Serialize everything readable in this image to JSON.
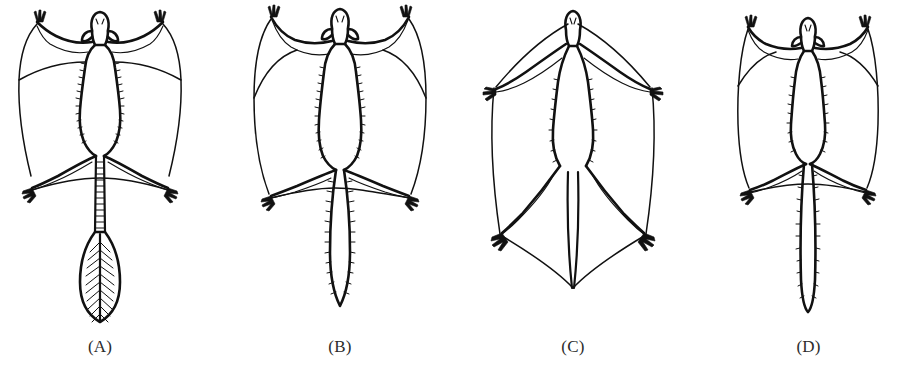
{
  "figure": {
    "kind": "scientific-line-drawing",
    "background_color": "#ffffff",
    "ink_color": "#111111",
    "label_color": "#2b2b2b",
    "width": 899,
    "height": 382
  },
  "panels": [
    {
      "id": "A",
      "label": "(A)",
      "center_x": 95,
      "description": "glider with long scaly tail ending in a feather-like plume; patagium spans wrist to ankle",
      "tail_type": "feather-tail",
      "tail_visible": true
    },
    {
      "id": "B",
      "label": "(B)",
      "center_x": 340,
      "description": "glider with broad, densely furred tapering tail; large rectangular patagium",
      "tail_type": "bushy-furred-tail",
      "tail_visible": true
    },
    {
      "id": "C",
      "label": "(C)",
      "center_x": 573,
      "description": "glider with membrane continuing between hind legs enclosing a short tail; widest patagium",
      "tail_type": "interfemoral-membrane-enclosed",
      "tail_visible": false
    },
    {
      "id": "D",
      "label": "(D)",
      "center_x": 818,
      "description": "smaller glider with long slender fringed tail; narrower patagium",
      "tail_type": "long-slender-tail",
      "tail_visible": true
    }
  ]
}
